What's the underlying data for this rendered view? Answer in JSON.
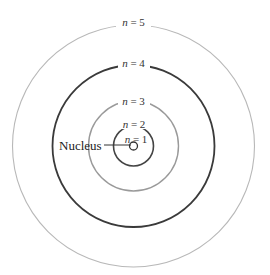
{
  "diagram": {
    "type": "bohr-model",
    "center": {
      "x": 133.5,
      "y": 146
    },
    "nucleus_label": "Nucleus",
    "orbits": [
      {
        "n": 1,
        "label": "n = 1",
        "radius": 4,
        "color": "#333333",
        "width": 1.3
      },
      {
        "n": 2,
        "label": "n = 2",
        "radius": 20,
        "color": "#444444",
        "width": 1.6
      },
      {
        "n": 3,
        "label": "n = 3",
        "radius": 45,
        "color": "#9a9a9a",
        "width": 1.4
      },
      {
        "n": 4,
        "label": "n = 4",
        "radius": 81,
        "color": "#3a3a3a",
        "width": 1.8
      },
      {
        "n": 5,
        "label": "n = 5",
        "radius": 121,
        "color": "#b8b8b8",
        "width": 1.1
      }
    ]
  }
}
